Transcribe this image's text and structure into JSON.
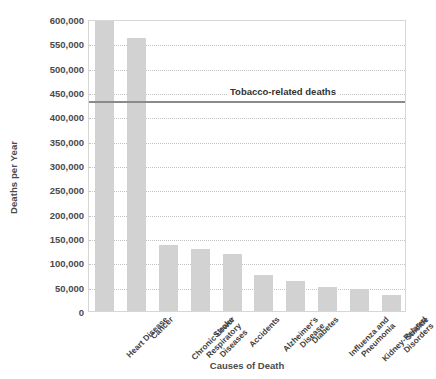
{
  "chart_data": {
    "type": "bar",
    "title": "",
    "xlabel": "Causes of Death",
    "ylabel": "Deaths per Year",
    "categories": [
      "Heart Disease",
      "Cancer",
      "Chronic Lower Respiratory Diseases",
      "Stroke",
      "Accidents",
      "Alzheimer's Disease",
      "Diabetes",
      "Influenza and Pneumonia",
      "Kidney-Related Disorders",
      "Suicide"
    ],
    "category_lines": [
      [
        "Heart Disease"
      ],
      [
        "Cancer"
      ],
      [
        "Chronic Lower",
        "Respiratory",
        "Diseases"
      ],
      [
        "Stroke"
      ],
      [
        "Accidents"
      ],
      [
        "Alzheimer's",
        "Disease"
      ],
      [
        "Diabetes"
      ],
      [
        "Influenza and",
        "Pneumonia"
      ],
      [
        "Kidney-Related",
        "Disorders"
      ],
      [
        "Suicide"
      ]
    ],
    "values": [
      595000,
      560000,
      135000,
      128000,
      118000,
      73000,
      62000,
      50000,
      45000,
      33000
    ],
    "ylim": [
      0,
      600000
    ],
    "ytick_values": [
      0,
      50000,
      100000,
      150000,
      200000,
      250000,
      300000,
      350000,
      400000,
      450000,
      500000,
      550000,
      600000
    ],
    "ytick_labels": [
      "0",
      "50,000",
      "100,000",
      "150,000",
      "200,000",
      "250,000",
      "300,000",
      "350,000",
      "400,000",
      "450,000",
      "500,000",
      "550,000",
      "600,000"
    ],
    "grid": "horizontal-dotted",
    "legend": "none",
    "bar_color": "#d2d2d2",
    "reference_line": {
      "label": "Tobacco-related deaths",
      "value": 435000,
      "color": "#8b8b8b"
    }
  }
}
